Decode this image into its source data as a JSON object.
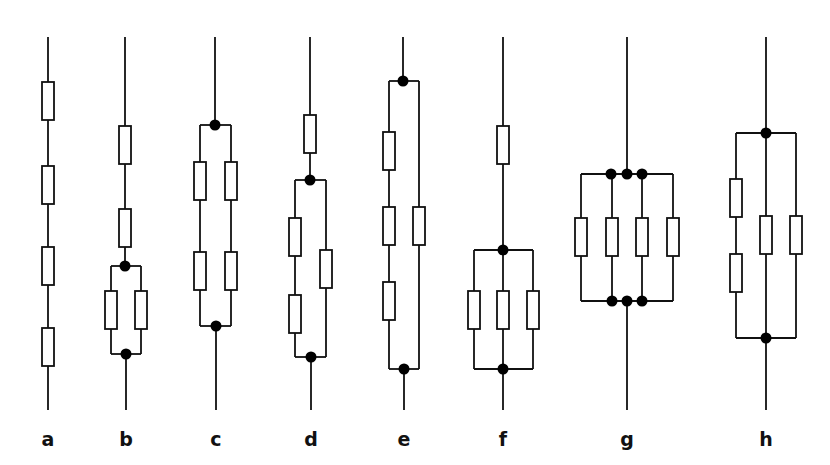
{
  "diagram": {
    "colors": {
      "stroke": "#111111",
      "node": "#000000",
      "background": "#ffffff"
    },
    "resistor_size": {
      "w": 12,
      "h": 38
    },
    "circuits": [
      {
        "label": "a",
        "description": "4 resistors in series",
        "labelX": 48,
        "wires": [
          [
            48,
            37,
            48,
            410
          ]
        ],
        "resistors": [
          [
            48,
            101
          ],
          [
            48,
            185
          ],
          [
            48,
            266
          ],
          [
            48,
            347
          ]
        ],
        "nodes": []
      },
      {
        "label": "b",
        "description": "2 resistors in series followed by 2 in parallel",
        "labelX": 126,
        "wires": [
          [
            125,
            37,
            125,
            266
          ],
          [
            111,
            266,
            141,
            266
          ],
          [
            111,
            266,
            111,
            354
          ],
          [
            141,
            266,
            141,
            354
          ],
          [
            111,
            354,
            141,
            354
          ],
          [
            126,
            354,
            126,
            410
          ]
        ],
        "resistors": [
          [
            125,
            145
          ],
          [
            125,
            228
          ],
          [
            111,
            310
          ],
          [
            141,
            310
          ]
        ],
        "nodes": [
          [
            125,
            266
          ],
          [
            126,
            354
          ]
        ]
      },
      {
        "label": "c",
        "description": "2 parallel branches, each with 2 resistors in series",
        "labelX": 216,
        "wires": [
          [
            215,
            37,
            215,
            125
          ],
          [
            200,
            125,
            231,
            125
          ],
          [
            200,
            125,
            200,
            326
          ],
          [
            231,
            125,
            231,
            326
          ],
          [
            200,
            326,
            231,
            326
          ],
          [
            216,
            326,
            216,
            410
          ]
        ],
        "resistors": [
          [
            200,
            181
          ],
          [
            231,
            181
          ],
          [
            200,
            271
          ],
          [
            231,
            271
          ]
        ],
        "nodes": [
          [
            215,
            125
          ],
          [
            216,
            326
          ]
        ]
      },
      {
        "label": "d",
        "description": "1 resistor in series with parallel of (2 series) and 1",
        "labelX": 311,
        "wires": [
          [
            310,
            37,
            310,
            180
          ],
          [
            295,
            180,
            326,
            180
          ],
          [
            295,
            180,
            295,
            357
          ],
          [
            326,
            180,
            326,
            357
          ],
          [
            295,
            357,
            326,
            357
          ],
          [
            311,
            357,
            311,
            410
          ]
        ],
        "resistors": [
          [
            310,
            134
          ],
          [
            295,
            237
          ],
          [
            295,
            314
          ],
          [
            326,
            269
          ]
        ],
        "nodes": [
          [
            310,
            180
          ],
          [
            311,
            357
          ]
        ]
      },
      {
        "label": "e",
        "description": "Parallel of (3 series) and 1 resistor",
        "labelX": 404,
        "wires": [
          [
            403,
            37,
            403,
            81
          ],
          [
            389,
            81,
            419,
            81
          ],
          [
            389,
            81,
            389,
            369
          ],
          [
            419,
            81,
            419,
            369
          ],
          [
            389,
            369,
            419,
            369
          ],
          [
            404,
            369,
            404,
            410
          ]
        ],
        "resistors": [
          [
            389,
            151
          ],
          [
            389,
            226
          ],
          [
            389,
            301
          ],
          [
            419,
            226
          ]
        ],
        "nodes": [
          [
            403,
            81
          ],
          [
            404,
            369
          ]
        ]
      },
      {
        "label": "f",
        "description": "1 resistor in series with 3 in parallel",
        "labelX": 503,
        "wires": [
          [
            503,
            37,
            503,
            250
          ],
          [
            474,
            250,
            533,
            250
          ],
          [
            474,
            250,
            474,
            369
          ],
          [
            503,
            250,
            503,
            369
          ],
          [
            533,
            250,
            533,
            369
          ],
          [
            474,
            369,
            533,
            369
          ],
          [
            503,
            369,
            503,
            410
          ]
        ],
        "resistors": [
          [
            503,
            145
          ],
          [
            474,
            310
          ],
          [
            503,
            310
          ],
          [
            533,
            310
          ]
        ],
        "nodes": [
          [
            503,
            250
          ],
          [
            503,
            369
          ]
        ]
      },
      {
        "label": "g",
        "description": "4 resistors in parallel",
        "labelX": 627,
        "wires": [
          [
            627,
            37,
            627,
            174
          ],
          [
            581,
            174,
            673,
            174
          ],
          [
            581,
            174,
            581,
            301
          ],
          [
            612,
            174,
            612,
            301
          ],
          [
            642,
            174,
            642,
            301
          ],
          [
            673,
            174,
            673,
            301
          ],
          [
            581,
            301,
            673,
            301
          ],
          [
            627,
            301,
            627,
            410
          ]
        ],
        "resistors": [
          [
            581,
            237
          ],
          [
            612,
            237
          ],
          [
            642,
            237
          ],
          [
            673,
            237
          ]
        ],
        "nodes": [
          [
            611,
            174
          ],
          [
            627,
            174
          ],
          [
            642,
            174
          ],
          [
            612,
            301
          ],
          [
            627,
            301
          ],
          [
            642,
            301
          ]
        ]
      },
      {
        "label": "h",
        "description": "Parallel of (2 series), 1 and 1 resistor",
        "labelX": 766,
        "wires": [
          [
            766,
            37,
            766,
            133
          ],
          [
            736,
            133,
            796,
            133
          ],
          [
            736,
            133,
            736,
            338
          ],
          [
            766,
            133,
            766,
            338
          ],
          [
            796,
            133,
            796,
            338
          ],
          [
            736,
            338,
            796,
            338
          ],
          [
            766,
            338,
            766,
            410
          ]
        ],
        "resistors": [
          [
            736,
            198
          ],
          [
            736,
            273
          ],
          [
            766,
            235
          ],
          [
            796,
            235
          ]
        ],
        "nodes": [
          [
            766,
            133
          ],
          [
            766,
            338
          ]
        ]
      }
    ]
  }
}
